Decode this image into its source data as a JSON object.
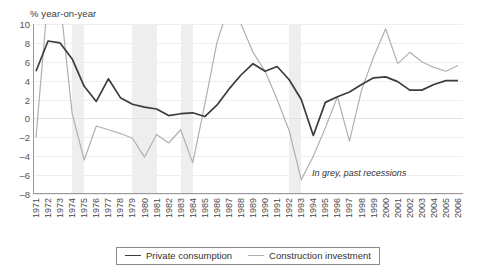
{
  "chart_data": {
    "type": "line",
    "title": "",
    "subtitle": "",
    "ylabel": "% year-on-year",
    "xlabel": "",
    "ylim": [
      -8,
      10
    ],
    "yticks": [
      10,
      8,
      6,
      4,
      2,
      0,
      -2,
      -4,
      -6,
      -8
    ],
    "grid": true,
    "legend_position": "bottom",
    "annotation": "In grey, past recessions",
    "categories": [
      "1971",
      "1972",
      "1973",
      "1974",
      "1975",
      "1976",
      "1977",
      "1978",
      "1979",
      "1980",
      "1981",
      "1982",
      "1983",
      "1984",
      "1985",
      "1986",
      "1987",
      "1988",
      "1989",
      "1990",
      "1991",
      "1992",
      "1993",
      "1994",
      "1995",
      "1996",
      "1997",
      "1998",
      "1999",
      "2000",
      "2001",
      "2002",
      "2003",
      "2004",
      "2005",
      "2006"
    ],
    "series": [
      {
        "name": "Private consumption",
        "color": "#3c3c3c",
        "values": [
          5.0,
          8.2,
          8.0,
          6.3,
          3.4,
          1.8,
          4.2,
          2.2,
          1.5,
          1.2,
          1.0,
          0.3,
          0.5,
          0.6,
          0.2,
          1.4,
          3.1,
          4.6,
          5.8,
          5.0,
          5.5,
          4.1,
          2.0,
          -1.8,
          1.7,
          2.3,
          2.8,
          3.6,
          4.3,
          4.4,
          3.9,
          3.0,
          3.0,
          3.6,
          4.0,
          4.0
        ]
      },
      {
        "name": "Construction investment",
        "color": "#b0b0b0",
        "values": [
          -2.0,
          13.0,
          12.5,
          0.5,
          -4.4,
          -0.8,
          -1.2,
          -1.6,
          -2.1,
          -4.1,
          -1.7,
          -2.6,
          -1.2,
          -4.7,
          1.5,
          8.0,
          12.0,
          10.0,
          7.0,
          5.0,
          2.0,
          -1.3,
          -6.5,
          -4.0,
          -1.0,
          2.3,
          -2.4,
          3.0,
          6.5,
          9.5,
          5.8,
          7.0,
          6.0,
          5.4,
          5.0,
          5.6
        ]
      }
    ],
    "recessions": [
      {
        "start": "1974",
        "end": "1975"
      },
      {
        "start": "1979",
        "end": "1981"
      },
      {
        "start": "1983",
        "end": "1984"
      },
      {
        "start": "1992",
        "end": "1993"
      }
    ]
  }
}
